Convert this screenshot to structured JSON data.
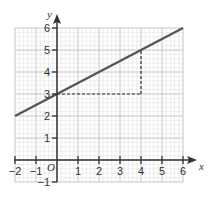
{
  "chart_data": {
    "type": "line",
    "title": "",
    "xlabel": "x",
    "ylabel": "y",
    "origin_label": "O",
    "xlim": [
      -2,
      6
    ],
    "ylim": [
      -1,
      6
    ],
    "grid": true,
    "x_ticks": [
      -2,
      -1,
      1,
      2,
      3,
      4,
      5,
      6
    ],
    "y_ticks": [
      -1,
      1,
      2,
      3,
      4,
      5,
      6
    ],
    "x_tick_labels": [
      "-2",
      "-1",
      "1",
      "2",
      "3",
      "4",
      "5",
      "6"
    ],
    "y_tick_labels": [
      "-1",
      "1",
      "2",
      "3",
      "4",
      "5",
      "6"
    ],
    "series": [
      {
        "name": "line",
        "equation": "y = 0.5x + 3",
        "x": [
          -2,
          6
        ],
        "y": [
          2,
          6
        ],
        "color": "#555555"
      }
    ],
    "annotations": [
      {
        "type": "dashed-segment",
        "from": [
          0,
          3
        ],
        "to": [
          4,
          3
        ],
        "label": "run = 4"
      },
      {
        "type": "dashed-segment",
        "from": [
          4,
          3
        ],
        "to": [
          4,
          5
        ],
        "label": "rise = 2"
      }
    ]
  },
  "colors": {
    "axis": "#333333",
    "grid_major": "#b8b8b8",
    "grid_minor": "#dddddd",
    "line": "#555555",
    "dashed": "#333333"
  }
}
